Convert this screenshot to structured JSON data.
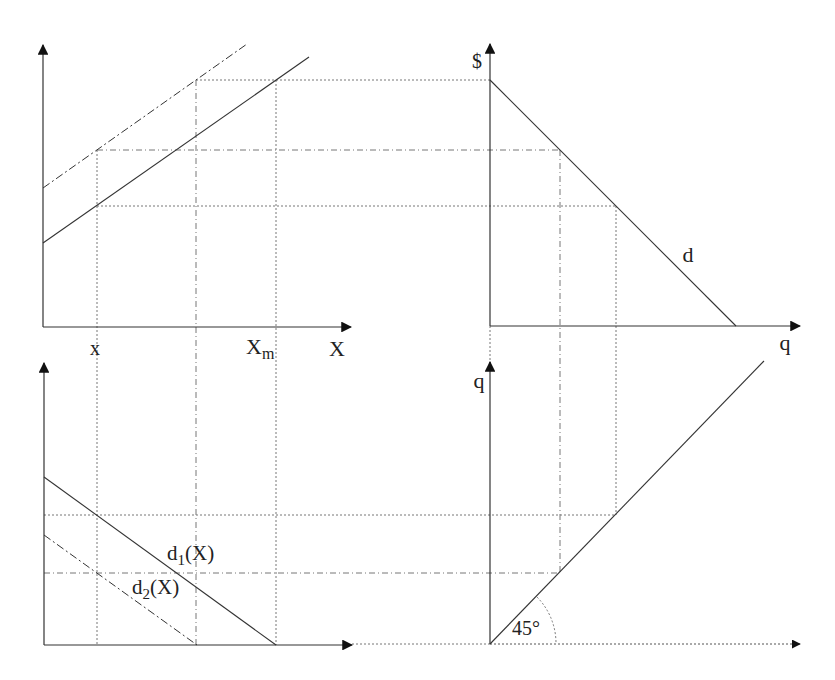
{
  "diagram": {
    "type": "four-quadrant economic diagram",
    "colors": {
      "line": "#333333",
      "guide": "#777777",
      "background": "#ffffff"
    },
    "top_left": {
      "x_axis_label": "X",
      "tick_labels": {
        "x": "x",
        "xm": "X",
        "xm_sub": "m"
      },
      "curves": [
        {
          "name": "upper-cost-line",
          "style": "dash-dot"
        },
        {
          "name": "lower-cost-line",
          "style": "solid"
        }
      ]
    },
    "top_right": {
      "y_axis_label": "$",
      "x_axis_label": "q",
      "curve_label": "d"
    },
    "bottom_left": {
      "curves": [
        {
          "label": "d",
          "sub": "1",
          "suffix": "(X)"
        },
        {
          "label": "d",
          "sub": "2",
          "suffix": "(X)"
        }
      ]
    },
    "bottom_right": {
      "y_axis_label": "q",
      "angle_label": "45°"
    }
  }
}
